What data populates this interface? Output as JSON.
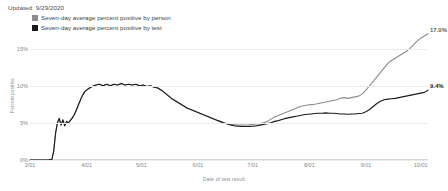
{
  "updated": "Updated: 9/29/2020",
  "legend": {
    "items": [
      {
        "label": "Seven-day average percent positive by person",
        "color": "#8c8c8c",
        "key": "person"
      },
      {
        "label": "Seven-day average percent positive by test",
        "color": "#1a1a1a",
        "key": "test"
      }
    ]
  },
  "annotations": {
    "person_end": "17.0%",
    "test_end": "9.4%"
  },
  "chart_data": {
    "type": "line",
    "title": "",
    "xlabel": "Date of test result",
    "ylabel": "Percent positive",
    "grid": true,
    "legend_position": "top-left",
    "xlim": [
      "3/01",
      "10/05"
    ],
    "ylim": [
      0,
      17.5
    ],
    "ytick_labels": [
      "0%",
      "5%",
      "10%",
      "15%"
    ],
    "ytick_values": [
      0,
      5,
      10,
      15
    ],
    "xtick_labels": [
      "3/01",
      "4/01",
      "5/01",
      "6/01",
      "7/01",
      "8/01",
      "9/01",
      "10/01"
    ],
    "xtick_days": [
      0,
      31,
      61,
      92,
      122,
      153,
      184,
      214
    ],
    "series": [
      {
        "name": "Seven-day average percent positive by person",
        "color": "#8c8c8c",
        "end_value": 17.0,
        "x": [
          0,
          4,
          8,
          10,
          12,
          13,
          14,
          15,
          16,
          17,
          18,
          19,
          20,
          21,
          22,
          23,
          24,
          25,
          26,
          27,
          28,
          29,
          30,
          32,
          34,
          36,
          38,
          40,
          42,
          44,
          46,
          48,
          50,
          52,
          54,
          56,
          58,
          60,
          62,
          64,
          66,
          68,
          70,
          72,
          74,
          76,
          78,
          80,
          82,
          84,
          86,
          88,
          90,
          92,
          94,
          96,
          98,
          100,
          102,
          104,
          106,
          108,
          110,
          112,
          114,
          116,
          118,
          120,
          122,
          124,
          126,
          128,
          130,
          132,
          134,
          136,
          138,
          140,
          142,
          144,
          146,
          148,
          150,
          152,
          154,
          156,
          158,
          160,
          162,
          164,
          166,
          168,
          170,
          172,
          174,
          176,
          178,
          180,
          182,
          184,
          186,
          188,
          190,
          192,
          194,
          196,
          198,
          200,
          202,
          204,
          206,
          208,
          210,
          212,
          214,
          216,
          218
        ],
        "y": [
          0,
          0,
          0,
          0,
          0.1,
          1.2,
          3.6,
          5.0,
          5.6,
          4.7,
          5.4,
          4.6,
          5.2,
          5.0,
          5.3,
          5.6,
          6.0,
          6.5,
          7.1,
          7.7,
          8.3,
          8.8,
          9.2,
          9.6,
          9.9,
          10.1,
          10.2,
          10.0,
          10.2,
          10.0,
          10.2,
          10.1,
          10.3,
          10.1,
          10.2,
          10.1,
          10.2,
          10.0,
          10.1,
          9.9,
          10.0,
          9.8,
          9.7,
          9.4,
          9.0,
          8.6,
          8.2,
          7.9,
          7.6,
          7.3,
          7.0,
          6.8,
          6.6,
          6.4,
          6.2,
          6.0,
          5.8,
          5.6,
          5.4,
          5.2,
          5.0,
          4.9,
          4.8,
          4.75,
          4.7,
          4.7,
          4.72,
          4.75,
          4.8,
          4.85,
          4.9,
          5.0,
          5.2,
          5.5,
          5.8,
          6.0,
          6.2,
          6.4,
          6.6,
          6.8,
          7.0,
          7.2,
          7.3,
          7.4,
          7.45,
          7.5,
          7.6,
          7.7,
          7.8,
          7.9,
          8.0,
          8.1,
          8.3,
          8.4,
          8.3,
          8.4,
          8.5,
          8.6,
          8.9,
          9.4,
          10.0,
          10.6,
          11.2,
          11.8,
          12.4,
          13.0,
          13.4,
          13.7,
          14.0,
          14.3,
          14.6,
          15.0,
          15.5,
          16.0,
          16.4,
          16.7,
          17.0
        ]
      },
      {
        "name": "Seven-day average percent positive by test",
        "color": "#1a1a1a",
        "end_value": 9.4,
        "x": [
          0,
          4,
          8,
          10,
          12,
          13,
          14,
          15,
          16,
          17,
          18,
          19,
          20,
          21,
          22,
          23,
          24,
          25,
          26,
          27,
          28,
          29,
          30,
          32,
          34,
          36,
          38,
          40,
          42,
          44,
          46,
          48,
          50,
          52,
          54,
          56,
          58,
          60,
          62,
          64,
          66,
          68,
          70,
          72,
          74,
          76,
          78,
          80,
          82,
          84,
          86,
          88,
          90,
          92,
          94,
          96,
          98,
          100,
          102,
          104,
          106,
          108,
          110,
          112,
          114,
          116,
          118,
          120,
          122,
          124,
          126,
          128,
          130,
          132,
          134,
          136,
          138,
          140,
          142,
          144,
          146,
          148,
          150,
          152,
          154,
          156,
          158,
          160,
          162,
          164,
          166,
          168,
          170,
          172,
          174,
          176,
          178,
          180,
          182,
          184,
          186,
          188,
          190,
          192,
          194,
          196,
          198,
          200,
          202,
          204,
          206,
          208,
          210,
          212,
          214,
          216,
          218
        ],
        "y": [
          0,
          0,
          0,
          0,
          0.1,
          1.2,
          3.6,
          5.0,
          5.6,
          4.7,
          5.4,
          4.6,
          5.2,
          5.0,
          5.3,
          5.6,
          6.0,
          6.5,
          7.1,
          7.7,
          8.3,
          8.8,
          9.2,
          9.6,
          9.9,
          10.1,
          10.2,
          10.0,
          10.2,
          10.0,
          10.2,
          10.1,
          10.3,
          10.1,
          10.2,
          10.1,
          10.2,
          10.0,
          10.1,
          9.9,
          10.0,
          9.8,
          9.7,
          9.4,
          9.0,
          8.6,
          8.2,
          7.9,
          7.6,
          7.3,
          7.0,
          6.8,
          6.6,
          6.4,
          6.2,
          6.0,
          5.8,
          5.6,
          5.4,
          5.2,
          5.0,
          4.85,
          4.7,
          4.6,
          4.55,
          4.5,
          4.5,
          4.52,
          4.55,
          4.6,
          4.7,
          4.8,
          4.9,
          5.0,
          5.2,
          5.3,
          5.45,
          5.6,
          5.7,
          5.8,
          5.9,
          6.0,
          6.1,
          6.15,
          6.2,
          6.25,
          6.3,
          6.3,
          6.35,
          6.3,
          6.3,
          6.25,
          6.2,
          6.2,
          6.15,
          6.2,
          6.2,
          6.25,
          6.3,
          6.5,
          6.8,
          7.2,
          7.6,
          7.9,
          8.1,
          8.2,
          8.25,
          8.3,
          8.4,
          8.5,
          8.6,
          8.7,
          8.8,
          8.9,
          9.0,
          9.1,
          9.4
        ]
      }
    ]
  }
}
